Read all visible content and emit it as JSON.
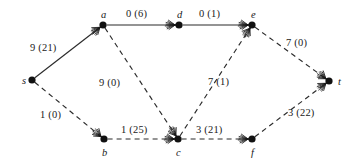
{
  "figure": {
    "background_color": "#ffffff",
    "ink_color": "#1a1a1a",
    "width": 359,
    "height": 168
  },
  "chart_data": {
    "type": "diagram",
    "subtype": "directed-flow-network",
    "title": "",
    "xlabel": "",
    "ylabel": "",
    "legend": [],
    "label_format": "flow (cost)",
    "nodes": [
      {
        "id": "s",
        "label": "s",
        "x": 32,
        "y": 80,
        "label_dx": -10,
        "label_dy": -4
      },
      {
        "id": "a",
        "label": "a",
        "x": 103,
        "y": 25,
        "label_dx": -2,
        "label_dy": -15
      },
      {
        "id": "d",
        "label": "d",
        "x": 179,
        "y": 25,
        "label_dx": -2,
        "label_dy": -15
      },
      {
        "id": "e",
        "label": "e",
        "x": 252,
        "y": 25,
        "label_dx": -1,
        "label_dy": -15
      },
      {
        "id": "t",
        "label": "t",
        "x": 329,
        "y": 81,
        "label_dx": 9,
        "label_dy": -4
      },
      {
        "id": "b",
        "label": "b",
        "x": 104,
        "y": 139,
        "label_dx": -2,
        "label_dy": 9
      },
      {
        "id": "c",
        "label": "c",
        "x": 178,
        "y": 139,
        "label_dx": -2,
        "label_dy": 9
      },
      {
        "id": "f",
        "label": "f",
        "x": 252,
        "y": 139,
        "label_dx": -1,
        "label_dy": 9
      }
    ],
    "edges": [
      {
        "id": "s-a",
        "from": "s",
        "to": "a",
        "style": "solid",
        "flow": 9,
        "cost": 21,
        "label": "9 (21)",
        "label_x": 30,
        "label_y": 43
      },
      {
        "id": "a-d",
        "from": "a",
        "to": "d",
        "style": "solid",
        "flow": 0,
        "cost": 6,
        "label": "0 (6)",
        "label_x": 126,
        "label_y": 9
      },
      {
        "id": "d-e",
        "from": "d",
        "to": "e",
        "style": "solid",
        "flow": 0,
        "cost": 1,
        "label": "0 (1)",
        "label_x": 199,
        "label_y": 9
      },
      {
        "id": "s-b",
        "from": "s",
        "to": "b",
        "style": "dashed",
        "flow": 1,
        "cost": 0,
        "label": "1 (0)",
        "label_x": 40,
        "label_y": 110
      },
      {
        "id": "a-c",
        "from": "a",
        "to": "c",
        "style": "dashed",
        "flow": 9,
        "cost": 0,
        "label": "9 (0)",
        "label_x": 99,
        "label_y": 78
      },
      {
        "id": "b-c",
        "from": "b",
        "to": "c",
        "style": "dashed",
        "flow": 1,
        "cost": 25,
        "label": "1 (25)",
        "label_x": 121,
        "label_y": 125
      },
      {
        "id": "c-e",
        "from": "c",
        "to": "e",
        "style": "dashed",
        "flow": 7,
        "cost": 1,
        "label": "7 (1)",
        "label_x": 208,
        "label_y": 77
      },
      {
        "id": "c-f",
        "from": "c",
        "to": "f",
        "style": "dashed",
        "flow": 3,
        "cost": 21,
        "label": "3 (21)",
        "label_x": 196,
        "label_y": 125
      },
      {
        "id": "e-t",
        "from": "e",
        "to": "t",
        "style": "dashed",
        "flow": 7,
        "cost": 0,
        "label": "7 (0)",
        "label_x": 286,
        "label_y": 38
      },
      {
        "id": "f-t",
        "from": "f",
        "to": "t",
        "style": "dashed",
        "flow": 3,
        "cost": 22,
        "label": "3 (22)",
        "label_x": 288,
        "label_y": 108
      }
    ]
  }
}
